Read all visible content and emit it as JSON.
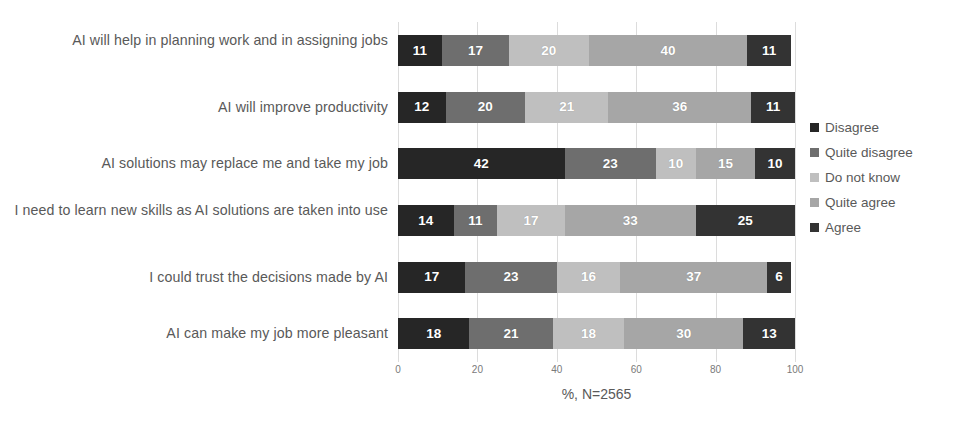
{
  "chart_data": {
    "type": "bar",
    "orientation": "horizontal",
    "stacked": true,
    "stack_mode": "percent",
    "title": "",
    "subtitle": "",
    "xlabel": "%, N=2565",
    "ylabel": "",
    "xlim": [
      0,
      100
    ],
    "xticks": [
      0,
      20,
      40,
      60,
      80,
      100
    ],
    "xticklabels": [
      "0",
      "20",
      "40",
      "60",
      "80",
      "100"
    ],
    "grid": true,
    "grid_axis": "x",
    "legend_position": "right",
    "categories": [
      "AI will help in planning work and in assigning jobs",
      "AI will improve productivity",
      "AI solutions may replace me and take my job",
      "I need to learn new skills as AI solutions are taken into use",
      "I could trust the decisions made by AI",
      "AI can make my job more pleasant"
    ],
    "series": [
      {
        "name": "Disagree",
        "color": "#262626",
        "values": [
          11,
          12,
          42,
          14,
          17,
          18
        ]
      },
      {
        "name": "Quite disagree",
        "color": "#6e6e6e",
        "values": [
          17,
          20,
          23,
          11,
          23,
          21
        ]
      },
      {
        "name": "Do not know",
        "color": "#bfbfbf",
        "values": [
          20,
          21,
          10,
          17,
          16,
          18
        ]
      },
      {
        "name": "Quite agree",
        "color": "#a6a6a6",
        "values": [
          40,
          36,
          15,
          33,
          37,
          30
        ]
      },
      {
        "name": "Agree",
        "color": "#333333",
        "values": [
          11,
          11,
          10,
          25,
          6,
          13
        ]
      }
    ]
  },
  "legend": {
    "items": [
      {
        "label": "Disagree",
        "color": "#262626"
      },
      {
        "label": "Quite disagree",
        "color": "#6e6e6e"
      },
      {
        "label": "Do not know",
        "color": "#bfbfbf"
      },
      {
        "label": "Quite agree",
        "color": "#a6a6a6"
      },
      {
        "label": "Agree",
        "color": "#333333"
      }
    ]
  },
  "axis": {
    "x_title": "%, N=2565",
    "ticks": [
      "0",
      "20",
      "40",
      "60",
      "80",
      "100"
    ]
  }
}
